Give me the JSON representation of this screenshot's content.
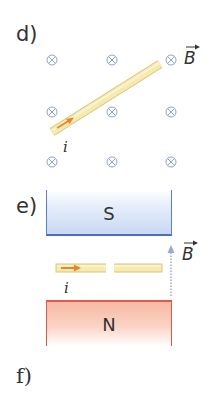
{
  "parts": {
    "d": {
      "label": "d)",
      "field_symbol": "⊗",
      "field_label": "B",
      "current_label": "i",
      "field_grid": {
        "columns_x": [
          52,
          112,
          171
        ],
        "rows_y": [
          60,
          112,
          162
        ]
      }
    },
    "e": {
      "label": "e)",
      "top_magnet_label": "S",
      "bottom_magnet_label": "N",
      "field_label": "B",
      "current_label": "i"
    },
    "f": {
      "label": "f)"
    }
  },
  "colors": {
    "text": "#333333",
    "field_symbol": "#8fa2d8",
    "wire_fill": "#f6eab0",
    "wire_edge": "#d9c77a",
    "current_arrow": "#e8862c",
    "south_magnet_edge": "#4a6fc2",
    "north_magnet_edge": "#e05a4a",
    "field_arrow": "#9aaad6"
  }
}
